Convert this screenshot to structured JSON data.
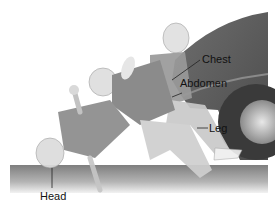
{
  "figure": {
    "colors": {
      "background": "#ffffff",
      "ground": "#8a8a8a",
      "car_body": "#5a5a5a",
      "tire": "#3c3c3c",
      "figure_shirt": "#7a7a7a",
      "figure_skin": "#d8d8d8",
      "label_text": "#111111"
    }
  },
  "labels": {
    "chest": "Chest",
    "abdomen": "Abdomen",
    "leg": "Leg",
    "head": "Head"
  }
}
